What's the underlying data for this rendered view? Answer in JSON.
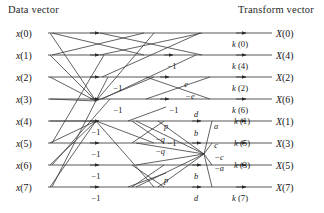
{
  "figure": {
    "type": "signal-flow-graph",
    "header_left": "Data vector",
    "header_right": "Transform vector",
    "stages": 3,
    "size": 8
  },
  "inputs": [
    {
      "name": "x(0)",
      "base": "x",
      "index": "(0)",
      "y": 33
    },
    {
      "name": "x(1)",
      "base": "x",
      "index": "(1)",
      "y": 55
    },
    {
      "name": "x(2)",
      "base": "x",
      "index": "(2)",
      "y": 77
    },
    {
      "name": "x(3)",
      "base": "x",
      "index": "(3)",
      "y": 99
    },
    {
      "name": "x(4)",
      "base": "x",
      "index": "(4)",
      "y": 121
    },
    {
      "name": "x(5)",
      "base": "x",
      "index": "(5)",
      "y": 143
    },
    {
      "name": "x(6)",
      "base": "x",
      "index": "(6)",
      "y": 165
    },
    {
      "name": "x(7)",
      "base": "x",
      "index": "(7)",
      "y": 187
    }
  ],
  "outputs": [
    {
      "name": "X(0)",
      "base": "X",
      "index": "(0)",
      "y": 33
    },
    {
      "name": "X(4)",
      "base": "X",
      "index": "(4)",
      "y": 55
    },
    {
      "name": "X(2)",
      "base": "X",
      "index": "(2)",
      "y": 77
    },
    {
      "name": "X(6)",
      "base": "X",
      "index": "(6)",
      "y": 99
    },
    {
      "name": "X(1)",
      "base": "X",
      "index": "(1)",
      "y": 121
    },
    {
      "name": "X(3)",
      "base": "X",
      "index": "(3)",
      "y": 143
    },
    {
      "name": "X(5)",
      "base": "X",
      "index": "(5)",
      "y": 165
    },
    {
      "name": "X(7)",
      "base": "X",
      "index": "(7)",
      "y": 187
    }
  ],
  "k_labels": [
    {
      "text": "k (0)",
      "base": "k",
      "index": "(0)",
      "x": 240,
      "y": 44
    },
    {
      "text": "k (4)",
      "base": "k",
      "index": "(4)",
      "x": 240,
      "y": 66
    },
    {
      "text": "k (2)",
      "base": "k",
      "index": "(2)",
      "x": 240,
      "y": 88
    },
    {
      "text": "k (6)",
      "base": "k",
      "index": "(6)",
      "x": 240,
      "y": 110
    },
    {
      "text": "k (1)",
      "base": "k",
      "index": "(1)",
      "x": 242,
      "y": 121
    },
    {
      "text": "k (5)",
      "base": "k",
      "index": "(5)",
      "x": 242,
      "y": 143
    },
    {
      "text": "k (3)",
      "base": "k",
      "index": "(3)",
      "x": 242,
      "y": 165
    },
    {
      "text": "k (7)",
      "base": "k",
      "index": "(7)",
      "x": 240,
      "y": 198
    }
  ],
  "coefficients": [
    {
      "text": "−1",
      "x": 118,
      "y": 88
    },
    {
      "text": "−1",
      "x": 118,
      "y": 110
    },
    {
      "text": "−1",
      "x": 172,
      "y": 66
    },
    {
      "text": "−1",
      "x": 174,
      "y": 110
    },
    {
      "text": "−1",
      "x": 96,
      "y": 132
    },
    {
      "text": "−1",
      "x": 96,
      "y": 154
    },
    {
      "text": "−1",
      "x": 96,
      "y": 176
    },
    {
      "text": "−1",
      "x": 96,
      "y": 198
    },
    {
      "text": "−1",
      "x": 172,
      "y": 143
    },
    {
      "text": "e",
      "x": 186,
      "y": 84
    },
    {
      "text": "−e",
      "x": 190,
      "y": 96
    },
    {
      "text": "d",
      "x": 196,
      "y": 114
    },
    {
      "text": "d",
      "x": 196,
      "y": 198
    },
    {
      "text": "p",
      "x": 166,
      "y": 126
    },
    {
      "text": "p",
      "x": 166,
      "y": 180
    },
    {
      "text": "b",
      "x": 196,
      "y": 133
    },
    {
      "text": "b",
      "x": 196,
      "y": 176
    },
    {
      "text": "a",
      "x": 216,
      "y": 126
    },
    {
      "text": "−a",
      "x": 219,
      "y": 168
    },
    {
      "text": "c",
      "x": 216,
      "y": 145
    },
    {
      "text": "−c",
      "x": 219,
      "y": 157
    },
    {
      "text": "−q",
      "x": 160,
      "y": 139
    },
    {
      "text": "−q",
      "x": 160,
      "y": 151
    }
  ],
  "geometry": {
    "x_left_rail": 48,
    "x_stage1": 96,
    "x_stage2": 150,
    "x_stage3": 204,
    "x_right_rail": 272,
    "row_top": 33,
    "row_gap": 22,
    "line_color": "#3a3a3a"
  }
}
